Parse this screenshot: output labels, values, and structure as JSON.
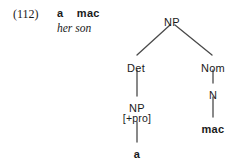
{
  "example": {
    "number_label": "(112)",
    "source_line": "a    mac",
    "translation_line": "her son"
  },
  "tree": {
    "nodes": [
      {
        "id": "np-root",
        "label": "NP",
        "x": 172,
        "y": 17,
        "kind": "category"
      },
      {
        "id": "det",
        "label": "Det",
        "x": 136,
        "y": 63,
        "kind": "category"
      },
      {
        "id": "nom",
        "label": "Nom",
        "x": 213,
        "y": 63,
        "kind": "category"
      },
      {
        "id": "np-pro",
        "label": "NP",
        "x": 137,
        "y": 103,
        "kind": "category"
      },
      {
        "id": "pro-feature",
        "label": "[+pro]",
        "x": 137,
        "y": 113,
        "kind": "feature"
      },
      {
        "id": "n",
        "label": "N",
        "x": 213,
        "y": 90,
        "kind": "category"
      },
      {
        "id": "terminal-a",
        "label": "a",
        "x": 137,
        "y": 149,
        "kind": "terminal"
      },
      {
        "id": "terminal-mac",
        "label": "mac",
        "x": 213,
        "y": 124,
        "kind": "terminal"
      }
    ],
    "edges": [
      {
        "id": "edge-np-det",
        "from": "np-root",
        "to": "det",
        "x1": 170,
        "y1": 25,
        "x2": 137,
        "y2": 55
      },
      {
        "id": "edge-np-nom",
        "from": "np-root",
        "to": "nom",
        "x1": 175,
        "y1": 25,
        "x2": 212,
        "y2": 55
      },
      {
        "id": "edge-det-nppro",
        "from": "det",
        "to": "np-pro",
        "x1": 137,
        "y1": 70,
        "x2": 137,
        "y2": 96
      },
      {
        "id": "edge-nppro-a",
        "from": "np-pro",
        "to": "terminal-a",
        "x1": 137,
        "y1": 122,
        "x2": 137,
        "y2": 142
      },
      {
        "id": "edge-nom-n",
        "from": "nom",
        "to": "n",
        "x1": 213,
        "y1": 70,
        "x2": 213,
        "y2": 83
      },
      {
        "id": "edge-n-mac",
        "from": "n",
        "to": "terminal-mac",
        "x1": 213,
        "y1": 97,
        "x2": 213,
        "y2": 117
      }
    ]
  },
  "style": {
    "ink_color": "#1a1a1a",
    "line_color": "#4a4a4a",
    "background_color": "#ffffff"
  }
}
